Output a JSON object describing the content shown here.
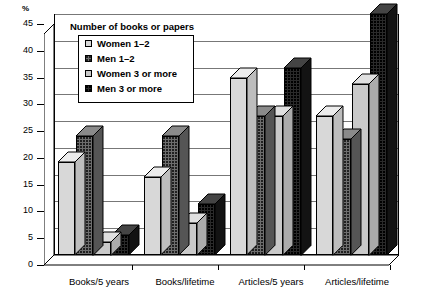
{
  "axis_unit": "%",
  "legend": {
    "title": "Number of books or papers",
    "items": [
      {
        "label": "Women 1–2",
        "key": "w12"
      },
      {
        "label": "Men 1–2",
        "key": "m12"
      },
      {
        "label": "Women 3 or more",
        "key": "w3"
      },
      {
        "label": "Men 3 or more",
        "key": "m3"
      }
    ]
  },
  "chart_data": {
    "type": "bar",
    "title": "Number of books or papers",
    "xlabel": "",
    "ylabel": "%",
    "ylim": [
      0,
      45
    ],
    "yticks": [
      0,
      5,
      10,
      15,
      20,
      25,
      30,
      35,
      40,
      45
    ],
    "ytick_labels": [
      "0",
      "5",
      "10",
      "15",
      "20",
      "25",
      "30",
      "35",
      "40",
      "45"
    ],
    "grid": true,
    "legend_position": "top-center-inset",
    "style": "3d-clustered-column",
    "categories": [
      "Books/5 years",
      "Books/lifetime",
      "Articles/5 years",
      "Articles/lifetime"
    ],
    "series": [
      {
        "name": "Women 1–2",
        "key": "w12",
        "values": [
          17.3,
          14.5,
          33.0,
          26.0
        ]
      },
      {
        "name": "Men 1–2",
        "key": "m12",
        "values": [
          22.3,
          22.2,
          26.0,
          21.7
        ]
      },
      {
        "name": "Women 3 or more",
        "key": "w3",
        "values": [
          2.5,
          6.0,
          26.0,
          32.0
        ]
      },
      {
        "name": "Men 3 or more",
        "key": "m3",
        "values": [
          3.7,
          9.5,
          35.0,
          45.0
        ]
      }
    ]
  }
}
